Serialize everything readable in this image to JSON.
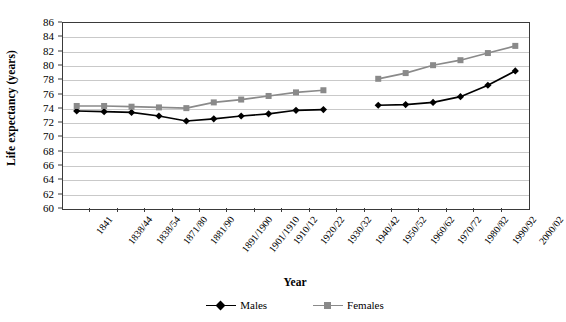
{
  "chart_data": {
    "type": "line",
    "title": "",
    "xlabel": "Year",
    "ylabel": "Life expectancy (years)",
    "categories": [
      "1841",
      "1838/44",
      "1838/54",
      "1871/80",
      "1881/90",
      "1891/1900",
      "1901/1910",
      "1910/12",
      "1920/22",
      "1930/32",
      "1940/42",
      "1950/52",
      "1960/62",
      "1970/72",
      "1980/82",
      "1990/92",
      "2000/02"
    ],
    "ylim": [
      60,
      86
    ],
    "ytick_step": 2,
    "yticks": [
      86,
      84,
      82,
      80,
      78,
      76,
      74,
      72,
      70,
      68,
      66,
      64,
      62,
      60
    ],
    "grid": true,
    "legend_position": "bottom",
    "series": [
      {
        "name": "Males",
        "color": "#000000",
        "marker": "diamond",
        "values": [
          73.7,
          73.6,
          73.5,
          73.0,
          72.3,
          72.6,
          73.0,
          73.3,
          73.8,
          73.9,
          null,
          74.5,
          74.6,
          74.9,
          75.7,
          77.3,
          79.3
        ]
      },
      {
        "name": "Females",
        "color": "#8a8a8a",
        "marker": "square",
        "values": [
          74.4,
          74.4,
          74.3,
          74.2,
          74.1,
          74.9,
          75.3,
          75.8,
          76.3,
          76.6,
          null,
          78.2,
          79.0,
          80.1,
          80.8,
          81.8,
          82.8
        ]
      }
    ]
  },
  "legend": {
    "entries": [
      {
        "label": "Males"
      },
      {
        "label": "Females"
      }
    ]
  },
  "axis_titles": {
    "x": "Year",
    "y": "Life expectancy (years)"
  }
}
